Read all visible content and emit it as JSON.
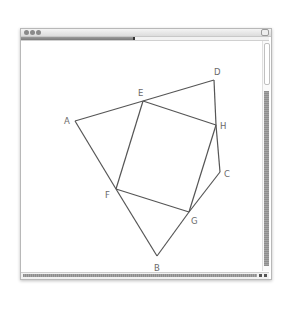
{
  "window": {
    "title_buttons": [
      "close",
      "minimize",
      "zoom"
    ],
    "progress_percent": 46
  },
  "diagram": {
    "stroke_color": "#555555",
    "label_color": "#6a6a6a",
    "points": {
      "A": {
        "x": 75,
        "y": 121
      },
      "B": {
        "x": 157,
        "y": 256
      },
      "C": {
        "x": 220,
        "y": 172
      },
      "D": {
        "x": 214,
        "y": 80
      },
      "E": {
        "x": 143,
        "y": 101
      },
      "F": {
        "x": 116,
        "y": 189
      },
      "G": {
        "x": 189,
        "y": 212
      },
      "H": {
        "x": 216,
        "y": 125
      }
    },
    "labels": {
      "A": "A",
      "B": "B",
      "C": "C",
      "D": "D",
      "E": "E",
      "F": "F",
      "G": "G",
      "H": "H"
    },
    "edges": [
      [
        "A",
        "E"
      ],
      [
        "E",
        "D"
      ],
      [
        "D",
        "H"
      ],
      [
        "H",
        "C"
      ],
      [
        "C",
        "G"
      ],
      [
        "G",
        "B"
      ],
      [
        "B",
        "F"
      ],
      [
        "F",
        "A"
      ],
      [
        "E",
        "H"
      ],
      [
        "H",
        "G"
      ],
      [
        "G",
        "F"
      ],
      [
        "F",
        "E"
      ]
    ]
  }
}
